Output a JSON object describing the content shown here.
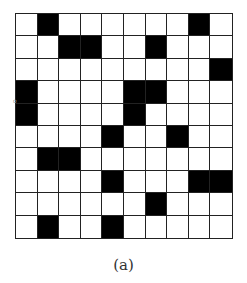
{
  "figure": {
    "caption": "(a)",
    "grid": {
      "rows": 10,
      "cols": 10,
      "filled_color": "#000000",
      "empty_color": "#ffffff",
      "line_color": "#222222",
      "cells": [
        [
          0,
          1,
          0,
          0,
          0,
          0,
          0,
          0,
          1,
          0
        ],
        [
          0,
          0,
          1,
          1,
          0,
          0,
          1,
          0,
          0,
          0
        ],
        [
          0,
          0,
          0,
          0,
          0,
          0,
          0,
          0,
          0,
          1
        ],
        [
          1,
          0,
          0,
          0,
          0,
          1,
          1,
          0,
          0,
          0
        ],
        [
          1,
          0,
          0,
          0,
          0,
          1,
          0,
          0,
          0,
          0
        ],
        [
          0,
          0,
          0,
          0,
          1,
          0,
          0,
          1,
          0,
          0
        ],
        [
          0,
          1,
          1,
          0,
          0,
          0,
          0,
          0,
          0,
          0
        ],
        [
          0,
          0,
          0,
          0,
          1,
          0,
          0,
          0,
          1,
          1
        ],
        [
          0,
          0,
          0,
          0,
          0,
          0,
          1,
          0,
          0,
          0
        ],
        [
          0,
          1,
          0,
          0,
          1,
          0,
          0,
          0,
          0,
          0
        ]
      ]
    },
    "margin_mark": "o"
  }
}
